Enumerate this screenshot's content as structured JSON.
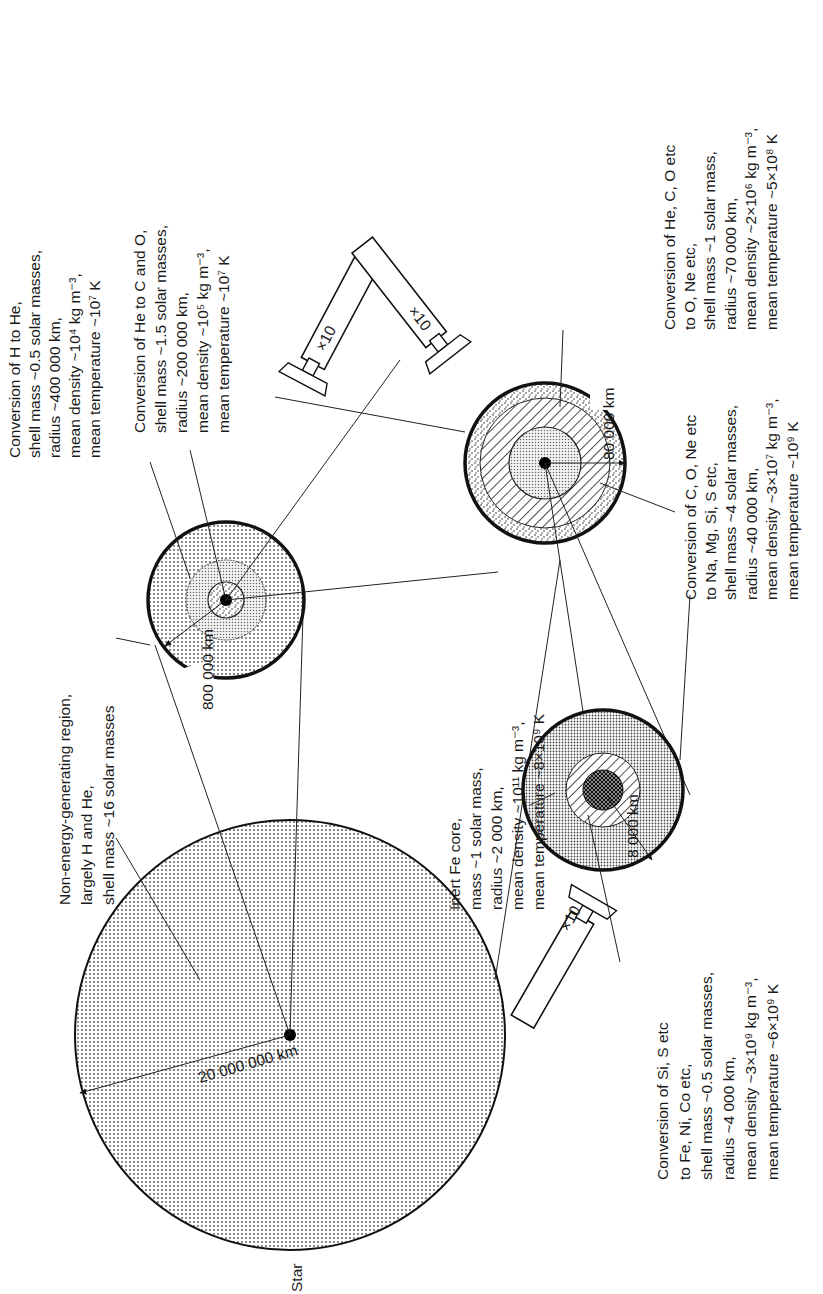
{
  "diagram": {
    "title_label": "Star",
    "scales": {
      "star_radius": "20 000 000 km",
      "glass1_radius": "800 000 km",
      "glass2_radius": "80 000 km",
      "glass3_radius": "8 000 km",
      "magnification": "×10"
    },
    "labels": {
      "envelope": [
        "Non-energy-generating region,",
        "largely H and He,",
        "shell mass ~16 solar masses"
      ],
      "h_to_he": [
        "Conversion of H to He,",
        "shell mass ~0.5 solar masses,",
        "radius ~400 000 km,",
        "mean density ~10⁴ kg m⁻³,",
        "mean temperature ~10⁷ K"
      ],
      "he_to_co": [
        "Conversion of He to C and O,",
        "shell mass ~1.5 solar masses,",
        "radius ~200 000 km,",
        "mean density ~10⁵ kg m⁻³,",
        "mean temperature ~10⁷ K"
      ],
      "hecO_to_one": [
        "Conversion of He, C, O etc",
        "to O, Ne etc,",
        "shell mass ~1 solar mass,",
        "radius ~70 000 km,",
        "mean density ~2×10⁶ kg m⁻³,",
        "mean temperature ~5×10⁸ K"
      ],
      "cone_to_namgsi": [
        "Conversion of C, O, Ne etc",
        "to Na, Mg, Si, S etc,",
        "shell mass ~4 solar masses,",
        "radius ~40 000 km,",
        "mean density ~3×10⁷ kg m⁻³,",
        "mean temperature ~10⁹ K"
      ],
      "fe_core": [
        "Inert Fe core,",
        "mass ~1 solar mass,",
        "radius ~2 000 km,",
        "mean density ~10¹¹ kg m⁻³,",
        "mean temperature ~8×10⁹ K"
      ],
      "sis_to_feni": [
        "Conversion of Si, S etc",
        "to Fe, Ni, Co etc,",
        "shell mass ~0.5 solar masses,",
        "radius ~4 000 km,",
        "mean density ~3×10⁹ kg m⁻³,",
        "mean temperature ~6×10⁹ K"
      ]
    }
  }
}
